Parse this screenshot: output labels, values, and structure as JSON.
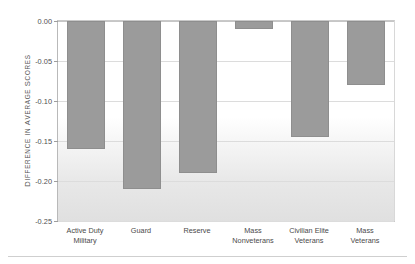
{
  "chart_data": {
    "type": "bar",
    "title": "",
    "subtitle": "",
    "xlabel": "",
    "ylabel": "DIFFERENCE IN AVERAGE SCORES",
    "ylim": [
      -0.25,
      0.0
    ],
    "ytick_labels": [
      "0.00",
      "-0.05",
      "-0.10",
      "-0.15",
      "-0.20",
      "-0.25"
    ],
    "ytick_values": [
      0.0,
      -0.05,
      -0.1,
      -0.15,
      -0.2,
      -0.25
    ],
    "grid": true,
    "legend": null,
    "orientation": "vertical",
    "bar_color": "#9b9b9b",
    "bar_edge_color": "#8e8e8e",
    "categories": [
      "Active Duty\nMilitary",
      "Guard",
      "Reserve",
      "Mass\nNonveterans",
      "Civilian Elite\nVeterans",
      "Mass\nVeterans"
    ],
    "values": [
      -0.16,
      -0.21,
      -0.19,
      -0.01,
      -0.145,
      -0.08
    ],
    "series": [
      {
        "name": "Difference in average scores",
        "values": [
          -0.16,
          -0.21,
          -0.19,
          -0.01,
          -0.145,
          -0.08
        ]
      }
    ]
  },
  "axis": {
    "y_title_first_letters": [
      "D",
      "IFFERENCE IN ",
      "A",
      "VERAGE ",
      "S",
      "CORES"
    ]
  }
}
